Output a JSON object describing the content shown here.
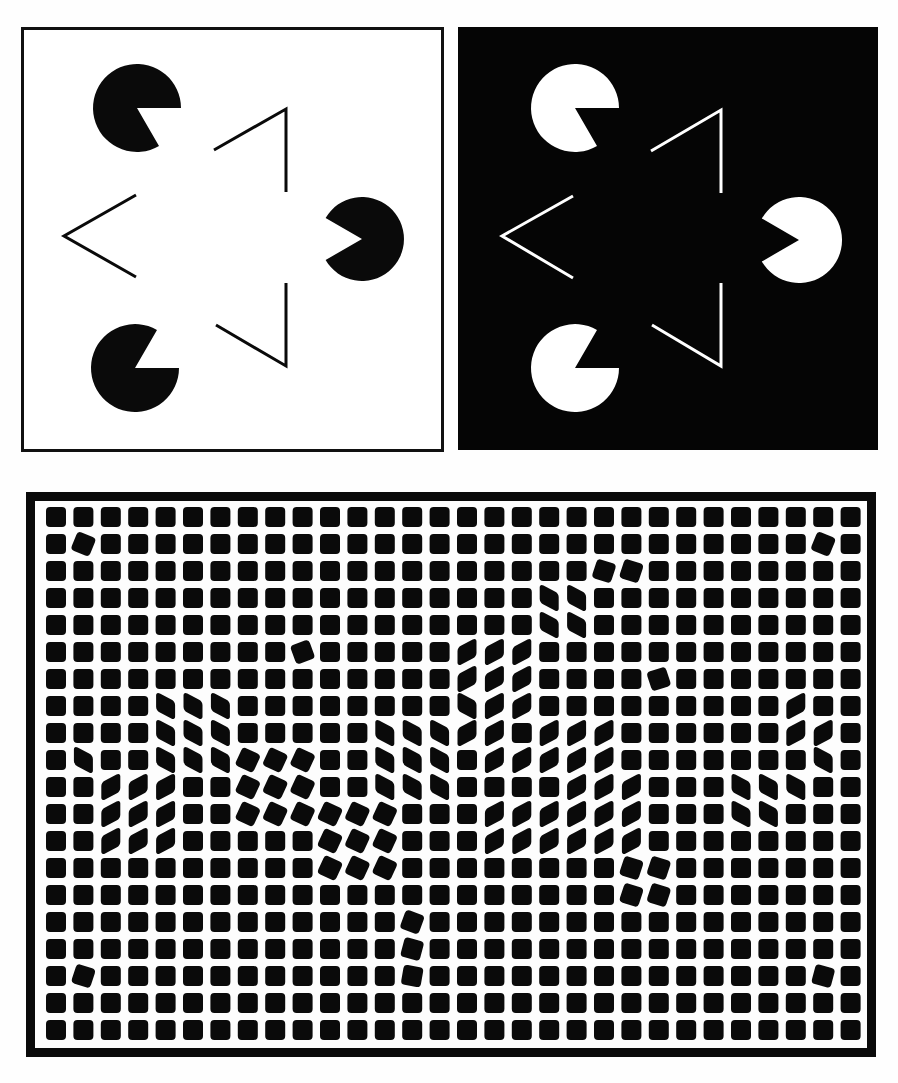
{
  "panels": {
    "kanizsa_white": {
      "label": "kanizsa-triangle-white-background",
      "background": "#ffffff",
      "foreground": "#0a0a0a",
      "pacmen": [
        {
          "cx": 137,
          "cy": 108,
          "r": 44,
          "mouth_dir_deg": 30
        },
        {
          "cx": 362,
          "cy": 239,
          "r": 42,
          "mouth_dir_deg": 180
        },
        {
          "cx": 135,
          "cy": 368,
          "r": 44,
          "mouth_dir_deg": -30
        }
      ],
      "chevrons": [
        {
          "points": "214,150 286,109 286,192"
        },
        {
          "points": "136,195 64,236 136,277"
        },
        {
          "points": "216,325 286,366 286,283"
        }
      ]
    },
    "kanizsa_black": {
      "label": "kanizsa-triangle-black-background",
      "background": "#050505",
      "foreground": "#ffffff",
      "pacmen": [
        {
          "cx": 575,
          "cy": 108,
          "r": 44,
          "mouth_dir_deg": 30
        },
        {
          "cx": 799,
          "cy": 240,
          "r": 43,
          "mouth_dir_deg": 180
        },
        {
          "cx": 575,
          "cy": 368,
          "r": 44,
          "mouth_dir_deg": -30
        }
      ],
      "chevrons": [
        {
          "points": "651,151 721,110 721,193"
        },
        {
          "points": "573,196 502,236 573,278"
        },
        {
          "points": "652,325 721,366 721,283"
        }
      ]
    },
    "tile_grid": {
      "label": "square-tile-grid-illusion",
      "columns": 30,
      "rows": 20,
      "tile_size": 20,
      "pitch_x": 27.4,
      "pitch_y": 27.0,
      "origin_x": 46,
      "origin_y": 507,
      "tile_color": "#0a0a0a",
      "rotated": [
        [
          1,
          1,
          22
        ],
        [
          28,
          1,
          22
        ],
        [
          20,
          2,
          18
        ],
        [
          21,
          2,
          18
        ],
        [
          9,
          5,
          -20
        ],
        [
          22,
          6,
          -18
        ],
        [
          1,
          17,
          18
        ],
        [
          28,
          17,
          15
        ],
        [
          13,
          15,
          20
        ],
        [
          13,
          16,
          15
        ],
        [
          13,
          17,
          10
        ],
        [
          21,
          13,
          18
        ],
        [
          22,
          13,
          18
        ],
        [
          21,
          14,
          18
        ],
        [
          22,
          14,
          18
        ],
        [
          7,
          9,
          25
        ],
        [
          8,
          9,
          25
        ],
        [
          9,
          9,
          25
        ],
        [
          7,
          10,
          25
        ],
        [
          8,
          10,
          25
        ],
        [
          9,
          10,
          25
        ],
        [
          7,
          11,
          25
        ],
        [
          8,
          11,
          25
        ],
        [
          9,
          11,
          25
        ],
        [
          10,
          11,
          25
        ],
        [
          11,
          11,
          25
        ],
        [
          12,
          11,
          25
        ],
        [
          10,
          12,
          25
        ],
        [
          11,
          12,
          25
        ],
        [
          12,
          12,
          25
        ],
        [
          10,
          13,
          25
        ],
        [
          11,
          13,
          25
        ],
        [
          12,
          13,
          25
        ]
      ],
      "skew_left": [
        [
          4,
          7
        ],
        [
          5,
          7
        ],
        [
          6,
          7
        ],
        [
          4,
          8
        ],
        [
          5,
          8
        ],
        [
          6,
          8
        ],
        [
          4,
          9
        ],
        [
          5,
          9
        ],
        [
          6,
          9
        ],
        [
          1,
          9
        ],
        [
          18,
          3
        ],
        [
          19,
          3
        ],
        [
          18,
          4
        ],
        [
          19,
          4
        ],
        [
          12,
          8
        ],
        [
          13,
          8
        ],
        [
          14,
          8
        ],
        [
          12,
          9
        ],
        [
          13,
          9
        ],
        [
          14,
          9
        ],
        [
          12,
          10
        ],
        [
          13,
          10
        ],
        [
          14,
          10
        ],
        [
          15,
          7
        ],
        [
          25,
          10
        ],
        [
          26,
          10
        ],
        [
          25,
          11
        ],
        [
          26,
          11
        ],
        [
          27,
          10
        ],
        [
          28,
          9
        ]
      ],
      "skew_right": [
        [
          2,
          10
        ],
        [
          3,
          10
        ],
        [
          4,
          10
        ],
        [
          2,
          11
        ],
        [
          3,
          11
        ],
        [
          4,
          11
        ],
        [
          2,
          12
        ],
        [
          3,
          12
        ],
        [
          4,
          12
        ],
        [
          15,
          5
        ],
        [
          16,
          5
        ],
        [
          17,
          5
        ],
        [
          15,
          6
        ],
        [
          16,
          6
        ],
        [
          17,
          6
        ],
        [
          15,
          7
        ],
        [
          16,
          7
        ],
        [
          17,
          7
        ],
        [
          15,
          8
        ],
        [
          16,
          8
        ],
        [
          18,
          8
        ],
        [
          19,
          8
        ],
        [
          20,
          8
        ],
        [
          18,
          9
        ],
        [
          19,
          9
        ],
        [
          20,
          9
        ],
        [
          17,
          9
        ],
        [
          16,
          9
        ],
        [
          19,
          10
        ],
        [
          20,
          10
        ],
        [
          21,
          10
        ],
        [
          19,
          11
        ],
        [
          20,
          11
        ],
        [
          21,
          11
        ],
        [
          19,
          12
        ],
        [
          20,
          12
        ],
        [
          21,
          12
        ],
        [
          27,
          7
        ],
        [
          27,
          8
        ],
        [
          28,
          8
        ],
        [
          16,
          11
        ],
        [
          17,
          11
        ],
        [
          18,
          11
        ],
        [
          16,
          12
        ],
        [
          17,
          12
        ],
        [
          18,
          12
        ]
      ]
    }
  }
}
